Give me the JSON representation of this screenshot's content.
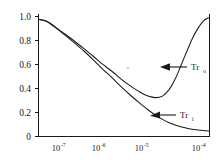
{
  "chart_data": {
    "type": "line",
    "title": "",
    "xlabel": "",
    "ylabel": "",
    "xscale": "log",
    "yscale": "linear",
    "xlim": [
      7e-08,
      0.000115
    ],
    "ylim": [
      0,
      1.05
    ],
    "grid": false,
    "legend": "inline-annotations",
    "xticks": [
      {
        "value": 1e-07,
        "base": "10",
        "exponent": "-7",
        "label": "10^-7"
      },
      {
        "value": 1e-06,
        "base": "10",
        "exponent": "-6",
        "label": "10^-6"
      },
      {
        "value": 1e-05,
        "base": "10",
        "exponent": "-5",
        "label": "10^-5"
      },
      {
        "value": 0.0001,
        "base": "10",
        "exponent": "-4",
        "label": "10^-4"
      }
    ],
    "yticks": [
      {
        "value": 1.0,
        "label": "1.0"
      },
      {
        "value": 0.8,
        "label": "0.8"
      },
      {
        "value": 0.6,
        "label": "0.6"
      },
      {
        "value": 0.4,
        "label": "0.4"
      },
      {
        "value": 0.2,
        "label": "0.2"
      },
      {
        "value": 0.0,
        "label": "0"
      }
    ],
    "series": [
      {
        "name": "Tr_o",
        "label_base": "Tr",
        "label_sub": "o",
        "description": "outer transmission: falls from 1.0 to a minimum near 0.33 then rises back toward 1.0",
        "x": [
          7e-08,
          1e-07,
          1.5e-07,
          2.2e-07,
          3.3e-07,
          5e-07,
          7.5e-07,
          1.1e-06,
          1.7e-06,
          2.5e-06,
          3.8e-06,
          5.6e-06,
          8e-06,
          1.1e-05,
          1.5e-05,
          2e-05,
          2.6e-05,
          3.3e-05,
          4.2e-05,
          5.4e-05,
          7e-05,
          8.8e-05,
          0.000105,
          0.000115
        ],
        "y": [
          1.0,
          0.985,
          0.93,
          0.875,
          0.815,
          0.75,
          0.685,
          0.62,
          0.555,
          0.49,
          0.43,
          0.38,
          0.345,
          0.332,
          0.345,
          0.4,
          0.49,
          0.6,
          0.715,
          0.83,
          0.925,
          0.985,
          1.01,
          1.015
        ]
      },
      {
        "name": "Tr_i",
        "label_base": "Tr",
        "label_sub": "i",
        "description": "inner transmission: monotonic decay from 1.0 flattening asymptotically near 0.05",
        "x": [
          7e-08,
          1e-07,
          1.5e-07,
          2.2e-07,
          3.3e-07,
          5e-07,
          7.5e-07,
          1.1e-06,
          1.7e-06,
          2.5e-06,
          3.8e-06,
          5.6e-06,
          8e-06,
          1.1e-05,
          1.5e-05,
          2e-05,
          2.6e-05,
          3.3e-05,
          4.5e-05,
          6e-05,
          8e-05,
          0.0001,
          0.000115
        ],
        "y": [
          1.0,
          0.982,
          0.925,
          0.865,
          0.8,
          0.73,
          0.655,
          0.58,
          0.5,
          0.425,
          0.35,
          0.285,
          0.228,
          0.183,
          0.146,
          0.118,
          0.098,
          0.083,
          0.069,
          0.06,
          0.053,
          0.049,
          0.047
        ]
      }
    ],
    "annotations": [
      {
        "name": "Tr_o",
        "text_base": "Tr",
        "text_sub": "o",
        "points_to": {
          "x": 4e-05,
          "y": 0.555
        },
        "arrow_direction": "left"
      },
      {
        "name": "Tr_i",
        "text_base": "Tr",
        "text_sub": "i",
        "points_to": {
          "x": 2.1e-05,
          "y": 0.135
        },
        "arrow_direction": "left"
      }
    ]
  }
}
